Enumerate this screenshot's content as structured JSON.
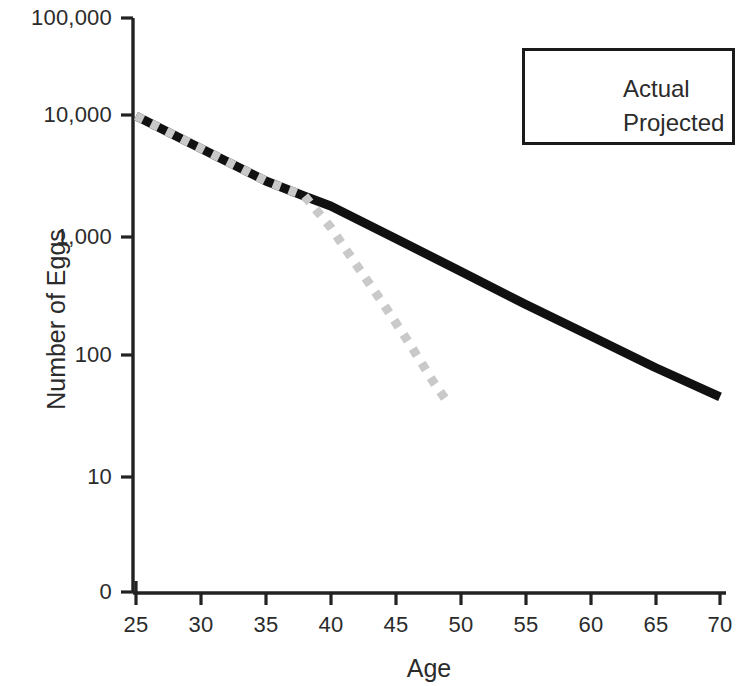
{
  "chart_data": {
    "type": "line",
    "title": "",
    "xlabel": "Age",
    "ylabel": "Number of Eggs",
    "yscale": "log",
    "xlim": [
      25,
      70
    ],
    "ylim": [
      0,
      100000
    ],
    "grid": false,
    "legend_position": "top-right",
    "x_ticks": [
      25,
      30,
      35,
      40,
      45,
      50,
      55,
      60,
      65,
      70
    ],
    "x_tick_labels": [
      "25",
      "30",
      "35",
      "40",
      "45",
      "50",
      "55",
      "60",
      "65",
      "70"
    ],
    "y_ticks": [
      0,
      10,
      100,
      1000,
      10000,
      100000
    ],
    "y_tick_labels": [
      "0",
      "10",
      "100",
      "1,000",
      "10,000",
      "100,000"
    ],
    "series": [
      {
        "name": "Actual",
        "style": "solid",
        "color": "#111111",
        "linewidth": 9,
        "x": [
          25,
          30,
          35,
          38,
          40,
          45,
          50,
          55,
          60,
          65,
          70
        ],
        "values": [
          14000,
          7300,
          3800,
          2800,
          2300,
          1200,
          620,
          320,
          170,
          90,
          50
        ]
      },
      {
        "name": "Projected",
        "style": "dotted",
        "color": "#c9c9c9",
        "linewidth": 9,
        "x": [
          25,
          30,
          35,
          38,
          40,
          42,
          44,
          46,
          48,
          49
        ],
        "values": [
          14000,
          7300,
          3800,
          2800,
          1500,
          700,
          330,
          150,
          65,
          45
        ]
      }
    ],
    "annotations": []
  },
  "legend": {
    "items": [
      {
        "label": "Actual",
        "swatch": "solid-line-swatch"
      },
      {
        "label": "Projected",
        "swatch": "dotted-line-swatch"
      }
    ]
  },
  "axes": {
    "x_title": "Age",
    "y_title": "Number of Eggs"
  }
}
